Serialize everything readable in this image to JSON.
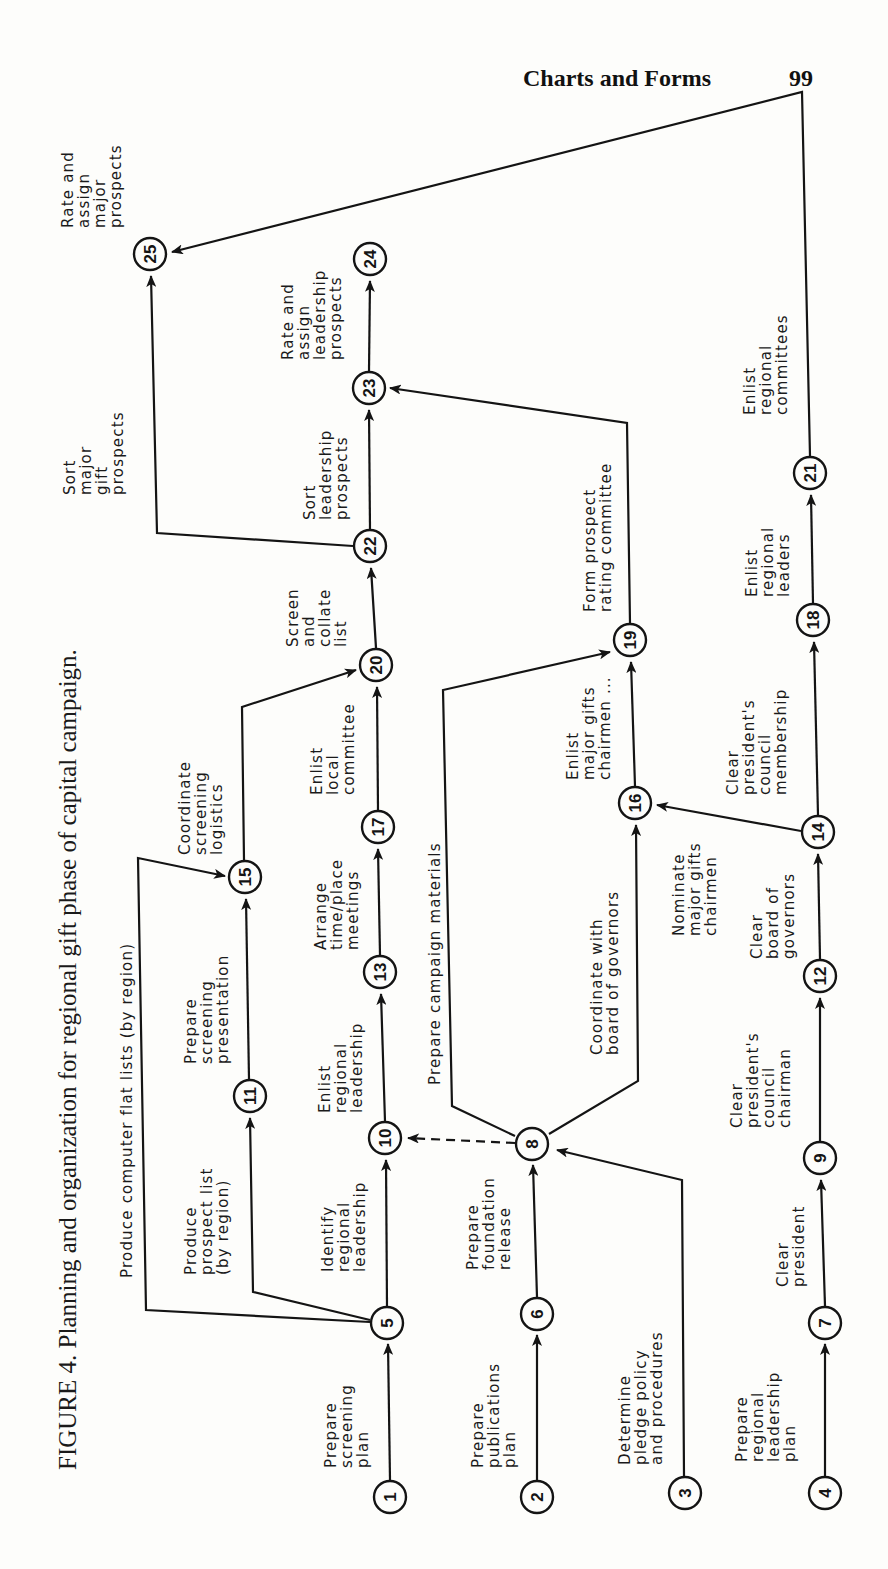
{
  "page_header": {
    "title": "Charts and Forms",
    "page_number": "99"
  },
  "caption": "FIGURE 4. Planning and organization for regional gift phase of capital campaign.",
  "diagram": {
    "type": "network flowchart (PERT-style), rotated 90° counter-clockwise",
    "nodes": [
      {
        "id": "1",
        "x": 390,
        "y": 1497
      },
      {
        "id": "2",
        "x": 537,
        "y": 1497
      },
      {
        "id": "3",
        "x": 685,
        "y": 1493
      },
      {
        "id": "4",
        "x": 825,
        "y": 1493
      },
      {
        "id": "5",
        "x": 387,
        "y": 1323
      },
      {
        "id": "6",
        "x": 537,
        "y": 1314
      },
      {
        "id": "7",
        "x": 825,
        "y": 1323
      },
      {
        "id": "8",
        "x": 532,
        "y": 1144
      },
      {
        "id": "9",
        "x": 820,
        "y": 1158
      },
      {
        "id": "10",
        "x": 385,
        "y": 1138
      },
      {
        "id": "11",
        "x": 250,
        "y": 1096
      },
      {
        "id": "12",
        "x": 820,
        "y": 976
      },
      {
        "id": "13",
        "x": 380,
        "y": 972
      },
      {
        "id": "14",
        "x": 818,
        "y": 832
      },
      {
        "id": "15",
        "x": 245,
        "y": 877
      },
      {
        "id": "16",
        "x": 635,
        "y": 803
      },
      {
        "id": "17",
        "x": 378,
        "y": 827
      },
      {
        "id": "18",
        "x": 813,
        "y": 620
      },
      {
        "id": "19",
        "x": 630,
        "y": 640
      },
      {
        "id": "20",
        "x": 376,
        "y": 665
      },
      {
        "id": "21",
        "x": 810,
        "y": 473
      },
      {
        "id": "22",
        "x": 370,
        "y": 546
      },
      {
        "id": "23",
        "x": 369,
        "y": 388
      },
      {
        "id": "24",
        "x": 370,
        "y": 259
      },
      {
        "id": "25",
        "x": 150,
        "y": 254
      }
    ],
    "edges": [
      {
        "from": "1",
        "to": "5",
        "label": "Prepare screening plan"
      },
      {
        "from": "2",
        "to": "6",
        "label": "Prepare publications plan"
      },
      {
        "from": "3",
        "to": "8",
        "label": "Determine pledge policy and procedures"
      },
      {
        "from": "4",
        "to": "7",
        "label": "Prepare regional leadership plan"
      },
      {
        "from": "5",
        "to": "10",
        "label": "Identify regional leadership"
      },
      {
        "from": "5",
        "to": "11",
        "label": "Produce prospect list (by region)"
      },
      {
        "from": "5",
        "to": "15",
        "label": "Produce computer flat lists (by region)"
      },
      {
        "from": "6",
        "to": "8",
        "label": "Prepare foundation release"
      },
      {
        "from": "7",
        "to": "9",
        "label": "Clear president"
      },
      {
        "from": "8",
        "to": "10",
        "label": "",
        "style": "dashed"
      },
      {
        "from": "8",
        "to": "19",
        "label": "Prepare campaign materials"
      },
      {
        "from": "8",
        "to": "16",
        "label": "Coordinate with board of governors"
      },
      {
        "from": "9",
        "to": "12",
        "label": "Clear president's council chairman"
      },
      {
        "from": "10",
        "to": "13",
        "label": "Enlist regional leadership"
      },
      {
        "from": "11",
        "to": "15",
        "label": "Prepare screening presentation"
      },
      {
        "from": "12",
        "to": "14",
        "label": "Clear board of governors"
      },
      {
        "from": "13",
        "to": "17",
        "label": "Arrange time/place meetings"
      },
      {
        "from": "14",
        "to": "16",
        "label": "Nominate major gifts chairmen"
      },
      {
        "from": "14",
        "to": "18",
        "label": "Clear president's council membership"
      },
      {
        "from": "15",
        "to": "20",
        "label": "Coordinate screening logistics"
      },
      {
        "from": "16",
        "to": "19",
        "label": "Enlist major gifts chairmen ..."
      },
      {
        "from": "17",
        "to": "20",
        "label": "Enlist local committee"
      },
      {
        "from": "18",
        "to": "21",
        "label": "Enlist regional leaders"
      },
      {
        "from": "19",
        "to": "23",
        "label": "Form prospect rating committee"
      },
      {
        "from": "20",
        "to": "22",
        "label": "Screen and collate list"
      },
      {
        "from": "21",
        "to": "25",
        "label": "Enlist regional committees"
      },
      {
        "from": "22",
        "to": "23",
        "label": "Sort leadership prospects"
      },
      {
        "from": "22",
        "to": "25",
        "label": "Sort major gift prospects"
      },
      {
        "from": "23",
        "to": "24",
        "label": "Rate and assign leadership prospects"
      },
      {
        "from": "25",
        "to": null,
        "label": "Rate and assign major prospects"
      }
    ]
  },
  "labels": {
    "l_1_5": [
      "Prepare",
      "screening",
      "plan"
    ],
    "l_2_6": [
      "Prepare",
      "publications",
      "plan"
    ],
    "l_3_8": [
      "Determine",
      "pledge policy",
      "and procedures"
    ],
    "l_4_7": [
      "Prepare",
      "regional",
      "leadership",
      "plan"
    ],
    "l_5_10": [
      "Identify",
      "regional",
      "leadership"
    ],
    "l_5_11": [
      "Produce",
      "prospect list",
      "(by region)"
    ],
    "l_5_15": [
      "Produce computer flat lists (by region)"
    ],
    "l_6_8": [
      "Prepare",
      "foundation",
      "release"
    ],
    "l_7_9": [
      "Clear",
      "president"
    ],
    "l_8_19": [
      "Prepare campaign materials"
    ],
    "l_8_16": [
      "Coordinate with",
      "board of governors"
    ],
    "l_9_12": [
      "Clear",
      "president's",
      "council",
      "chairman"
    ],
    "l_10_13": [
      "Enlist",
      "regional",
      "leadership"
    ],
    "l_11_15": [
      "Prepare",
      "screening",
      "presentation"
    ],
    "l_12_14": [
      "Clear",
      "board of",
      "governors"
    ],
    "l_13_17": [
      "Arrange",
      "time/place",
      "meetings"
    ],
    "l_14_16": [
      "Nominate",
      "major gifts",
      "chairmen"
    ],
    "l_14_18": [
      "Clear",
      "president's",
      "council",
      "membership"
    ],
    "l_15_20": [
      "Coordinate",
      "screening",
      "logistics"
    ],
    "l_16_19": [
      "Enlist",
      "major gifts",
      "chairmen ..."
    ],
    "l_17_20": [
      "Enlist",
      "local",
      "committee"
    ],
    "l_18_21": [
      "Enlist",
      "regional",
      "leaders"
    ],
    "l_19_23": [
      "Form prospect",
      "rating committee"
    ],
    "l_20_22": [
      "Screen",
      "and",
      "collate",
      "list"
    ],
    "l_21_25": [
      "Enlist",
      "regional",
      "committees"
    ],
    "l_22_23": [
      "Sort",
      "leadership",
      "prospects"
    ],
    "l_22_25": [
      "Sort",
      "major",
      "gift",
      "prospects"
    ],
    "l_23_24": [
      "Rate and",
      "assign",
      "leadership",
      "prospects"
    ],
    "l_25": [
      "Rate and",
      "assign",
      "major",
      "prospects"
    ]
  }
}
